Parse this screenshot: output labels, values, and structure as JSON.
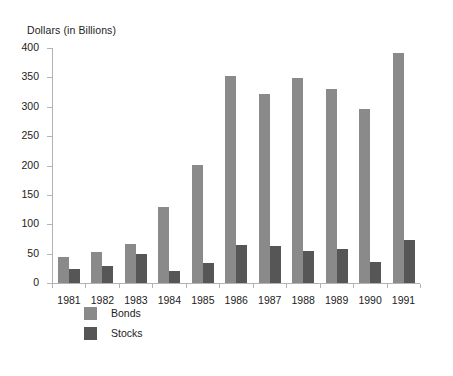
{
  "chart_data": {
    "type": "bar",
    "title": "",
    "xlabel": "",
    "ylabel": "Dollars (in Billions)",
    "categories": [
      "1981",
      "1982",
      "1983",
      "1984",
      "1985",
      "1986",
      "1987",
      "1988",
      "1989",
      "1990",
      "1991"
    ],
    "series": [
      {
        "name": "Bonds",
        "color": "#8a8a8a",
        "values": [
          44,
          52,
          66,
          130,
          201,
          353,
          322,
          349,
          331,
          296,
          392
        ]
      },
      {
        "name": "Stocks",
        "color": "#565656",
        "values": [
          24,
          29,
          49,
          21,
          34,
          65,
          63,
          55,
          58,
          36,
          74
        ]
      }
    ],
    "ylim": [
      0,
      400
    ],
    "ytick_values": [
      0,
      50,
      100,
      150,
      200,
      250,
      300,
      350,
      400
    ],
    "ytick_labels": [
      "0",
      "50",
      "100",
      "150",
      "200",
      "250",
      "300",
      "350",
      "400"
    ],
    "grid": false,
    "legend_position": "bottom-left",
    "axis_color": "#b3b3b3",
    "background": "#ffffff"
  }
}
